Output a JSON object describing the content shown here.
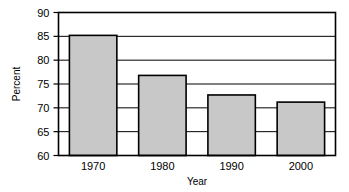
{
  "chart_data": {
    "type": "bar",
    "title": "",
    "subtitle": "",
    "xlabel": "Year",
    "ylabel": "Percent",
    "categories": [
      "1970",
      "1980",
      "1990",
      "2000"
    ],
    "values": [
      85.2,
      76.8,
      72.7,
      71.2
    ],
    "ylim": [
      60,
      90
    ],
    "yticks": [
      60,
      65,
      70,
      75,
      80,
      85,
      90
    ],
    "ytick_labels": [
      "60",
      "65",
      "70",
      "75",
      "80",
      "85",
      "90"
    ],
    "grid": true,
    "grid_axis": "y",
    "legend": false,
    "legend_position": "none",
    "bar_fill_color": "#c8c8c8",
    "bar_edge_color": "#000000",
    "axis_color": "#000000",
    "grid_color": "#000000",
    "background_color": "#ffffff"
  }
}
